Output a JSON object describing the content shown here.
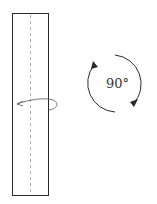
{
  "diagram": {
    "rotation_label": "90°",
    "colors": {
      "stroke": "#2a2a2a",
      "fold_line": "#b0b0b0",
      "background": "#ffffff"
    },
    "elements": [
      {
        "name": "paper-strip",
        "type": "rectangle"
      },
      {
        "name": "fold-line",
        "type": "dashed-line"
      },
      {
        "name": "turn-over-arrow",
        "type": "curved-arrow"
      },
      {
        "name": "rotate-arrows",
        "type": "circular-arrows",
        "label": "90°"
      }
    ]
  }
}
